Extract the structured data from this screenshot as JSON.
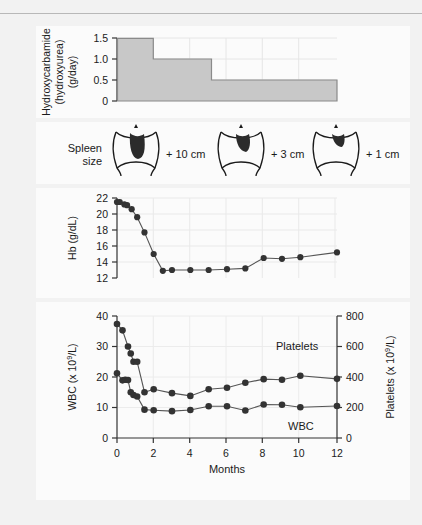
{
  "figure": {
    "background_color": "#f2f2f2",
    "panel_color": "#fbfbfb",
    "marker_color": "#333333",
    "line_color": "#555555",
    "bar_fill_color": "#c8c8c8",
    "bar_edge_color": "#8a8a8a",
    "spleen_fill_color": "#2b2b2b",
    "grid_color": "#e4e4e4",
    "axis_color": "#333333"
  },
  "panel_dose": {
    "ylabel_line1": "Hydroxycarbamide",
    "ylabel_line2": "(hydroxyurea)",
    "ylabel_line3": "(g/day)",
    "yticks": [
      "0",
      "0.5",
      "1.0",
      "1.5"
    ]
  },
  "panel_spleen": {
    "label_line1": "Spleen",
    "label_line2": "size",
    "items": [
      {
        "value": "+ 10 cm",
        "size": "large"
      },
      {
        "value": "+ 3 cm",
        "size": "medium"
      },
      {
        "value": "+ 1 cm",
        "size": "small"
      }
    ]
  },
  "panel_hb": {
    "ylabel": "Hb (g/dL)",
    "yticks": [
      "12",
      "14",
      "16",
      "18",
      "20",
      "22"
    ]
  },
  "panel_counts": {
    "ylabel_left_prefix": "WBC (x 10",
    "ylabel_left_sup": "9",
    "ylabel_left_suffix": "/L)",
    "ylabel_right_prefix": "Platelets (x 10",
    "ylabel_right_sup": "9",
    "ylabel_right_suffix": "/L)",
    "xlabel": "Months",
    "yticks_left": [
      "0",
      "10",
      "20",
      "30",
      "40"
    ],
    "yticks_right": [
      "0",
      "200",
      "400",
      "600",
      "800"
    ],
    "xticks": [
      "0",
      "2",
      "4",
      "6",
      "8",
      "10",
      "12"
    ],
    "series_label_platelets": "Platelets",
    "series_label_wbc": "WBC"
  },
  "chart_data": [
    {
      "type": "area",
      "name": "hydroxycarbamide_dose",
      "title": "Hydroxycarbamide (hydroxyurea) dose",
      "xlabel": "Months",
      "ylabel": "Hydroxycarbamide (hydroxyurea) (g/day)",
      "xlim": [
        0,
        12
      ],
      "ylim": [
        0,
        1.6
      ],
      "yticks": [
        0,
        0.5,
        1.0,
        1.5
      ],
      "grid": true,
      "step_style": "post",
      "steps": [
        {
          "x_start": 0,
          "x_end": 2.0,
          "value": 1.5
        },
        {
          "x_start": 2.0,
          "x_end": 5.2,
          "value": 1.0
        },
        {
          "x_start": 5.2,
          "x_end": 12,
          "value": 0.5
        }
      ]
    },
    {
      "type": "line",
      "name": "hemoglobin",
      "title": "Haemoglobin over time",
      "xlabel": "Months",
      "ylabel": "Hb (g/dL)",
      "xlim": [
        0,
        12
      ],
      "ylim": [
        12,
        22
      ],
      "yticks": [
        12,
        14,
        16,
        18,
        20,
        22
      ],
      "grid": true,
      "markers": "circle",
      "x": [
        0,
        0.15,
        0.4,
        0.55,
        0.8,
        1.1,
        1.5,
        2.0,
        2.5,
        3.0,
        4.0,
        5.0,
        6.0,
        7.0,
        8.0,
        9.0,
        10.0,
        12.0
      ],
      "y": [
        21.5,
        21.5,
        21.2,
        21.1,
        20.6,
        19.6,
        17.7,
        15.0,
        12.9,
        13.0,
        13.0,
        13.0,
        13.1,
        13.2,
        14.5,
        14.4,
        14.6,
        15.2
      ]
    },
    {
      "type": "line",
      "name": "wbc_and_platelets",
      "title": "WBC and platelet counts over time",
      "xlabel": "Months",
      "xlim": [
        0,
        12
      ],
      "grid": true,
      "markers": "circle",
      "axes": [
        {
          "side": "left",
          "label": "WBC (x 10^9/L)",
          "ylim": [
            0,
            40
          ],
          "yticks": [
            0,
            10,
            20,
            30,
            40
          ]
        },
        {
          "side": "right",
          "label": "Platelets (x 10^9/L)",
          "ylim": [
            0,
            800
          ],
          "yticks": [
            0,
            200,
            400,
            600,
            800
          ]
        }
      ],
      "series": [
        {
          "name": "WBC",
          "axis": "left",
          "unit": "x 10^9/L",
          "x": [
            0,
            0.3,
            0.45,
            0.6,
            0.75,
            0.9,
            1.1,
            1.5,
            2.0,
            3.0,
            4.0,
            5.0,
            6.0,
            7.0,
            8.0,
            9.0,
            10.0,
            12.0
          ],
          "y": [
            21.2,
            18.9,
            19.1,
            19.0,
            15.0,
            14.1,
            13.6,
            9.3,
            9.1,
            8.8,
            9.2,
            10.4,
            10.4,
            9.0,
            11.0,
            10.9,
            10.1,
            10.5
          ]
        },
        {
          "name": "Platelets",
          "axis": "right",
          "unit": "x 10^9/L",
          "x": [
            0,
            0.3,
            0.6,
            0.75,
            0.9,
            1.1,
            1.5,
            2.0,
            3.0,
            4.0,
            5.0,
            6.0,
            7.0,
            8.0,
            9.0,
            10.0,
            12.0
          ],
          "y": [
            748,
            705,
            600,
            553,
            500,
            500,
            300,
            320,
            293,
            275,
            320,
            330,
            362,
            385,
            382,
            408,
            388
          ],
          "y_in_left_axis_units": [
            37.4,
            35.3,
            30.0,
            27.7,
            25.0,
            25.0,
            15.0,
            16.0,
            14.7,
            13.8,
            16.0,
            16.5,
            18.1,
            19.3,
            19.1,
            20.4,
            19.4
          ]
        }
      ]
    }
  ]
}
